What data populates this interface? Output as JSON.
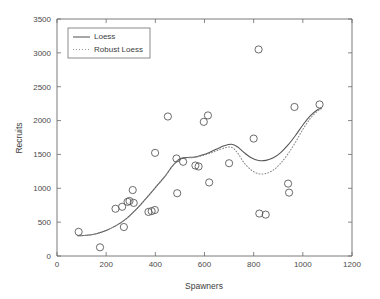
{
  "chart_data": {
    "type": "scatter",
    "title": "",
    "xlabel": "Spawners",
    "ylabel": "Recruits",
    "xlim": [
      0,
      1200
    ],
    "ylim": [
      0,
      3500
    ],
    "xticks": [
      0,
      200,
      400,
      600,
      800,
      1000,
      1200
    ],
    "yticks": [
      0,
      500,
      1000,
      1500,
      2000,
      2500,
      3000,
      3500
    ],
    "grid": false,
    "legend_position": "upper-left",
    "legend": [
      {
        "label": "Loess",
        "style": "solid"
      },
      {
        "label": "Robust Loess",
        "style": "dotted"
      }
    ],
    "scatter": {
      "name": "Observations",
      "marker": "open-circle",
      "points": [
        [
          88,
          357
        ],
        [
          175,
          128
        ],
        [
          238,
          698
        ],
        [
          265,
          727
        ],
        [
          272,
          428
        ],
        [
          287,
          800
        ],
        [
          295,
          812
        ],
        [
          308,
          974
        ],
        [
          312,
          784
        ],
        [
          372,
          651
        ],
        [
          385,
          663
        ],
        [
          398,
          679
        ],
        [
          399,
          1523
        ],
        [
          451,
          2060
        ],
        [
          486,
          1440
        ],
        [
          489,
          927
        ],
        [
          513,
          1391
        ],
        [
          563,
          1336
        ],
        [
          576,
          1322
        ],
        [
          597,
          1981
        ],
        [
          614,
          2076
        ],
        [
          619,
          1086
        ],
        [
          700,
          1370
        ],
        [
          800,
          1734
        ],
        [
          820,
          3050
        ],
        [
          823,
          627
        ],
        [
          849,
          611
        ],
        [
          940,
          1069
        ],
        [
          944,
          936
        ],
        [
          966,
          2201
        ],
        [
          1068,
          2238
        ]
      ]
    },
    "series": [
      {
        "name": "Loess",
        "style": "solid",
        "points": [
          [
            85,
            300
          ],
          [
            120,
            305
          ],
          [
            160,
            330
          ],
          [
            200,
            378
          ],
          [
            240,
            448
          ],
          [
            280,
            545
          ],
          [
            320,
            680
          ],
          [
            360,
            840
          ],
          [
            400,
            1010
          ],
          [
            440,
            1180
          ],
          [
            470,
            1330
          ],
          [
            500,
            1435
          ],
          [
            530,
            1455
          ],
          [
            560,
            1460
          ],
          [
            590,
            1490
          ],
          [
            620,
            1530
          ],
          [
            650,
            1580
          ],
          [
            680,
            1628
          ],
          [
            710,
            1650
          ],
          [
            735,
            1610
          ],
          [
            760,
            1530
          ],
          [
            790,
            1450
          ],
          [
            820,
            1410
          ],
          [
            850,
            1412
          ],
          [
            880,
            1450
          ],
          [
            910,
            1528
          ],
          [
            940,
            1640
          ],
          [
            970,
            1780
          ],
          [
            1000,
            1935
          ],
          [
            1030,
            2070
          ],
          [
            1060,
            2160
          ],
          [
            1075,
            2180
          ]
        ]
      },
      {
        "name": "Robust Loess",
        "style": "dotted",
        "points": [
          [
            85,
            300
          ],
          [
            120,
            305
          ],
          [
            160,
            330
          ],
          [
            200,
            378
          ],
          [
            240,
            448
          ],
          [
            280,
            545
          ],
          [
            320,
            680
          ],
          [
            360,
            840
          ],
          [
            400,
            1010
          ],
          [
            440,
            1180
          ],
          [
            470,
            1330
          ],
          [
            500,
            1430
          ],
          [
            530,
            1450
          ],
          [
            560,
            1455
          ],
          [
            590,
            1480
          ],
          [
            620,
            1515
          ],
          [
            650,
            1555
          ],
          [
            680,
            1595
          ],
          [
            710,
            1605
          ],
          [
            735,
            1520
          ],
          [
            760,
            1380
          ],
          [
            790,
            1270
          ],
          [
            820,
            1215
          ],
          [
            850,
            1218
          ],
          [
            880,
            1270
          ],
          [
            910,
            1370
          ],
          [
            940,
            1510
          ],
          [
            970,
            1680
          ],
          [
            1000,
            1870
          ],
          [
            1030,
            2030
          ],
          [
            1060,
            2140
          ],
          [
            1075,
            2175
          ]
        ]
      }
    ]
  }
}
